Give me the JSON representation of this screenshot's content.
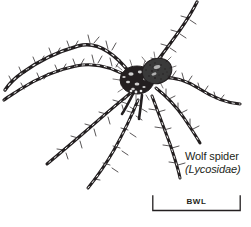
{
  "figure": {
    "background_color": "#ffffff",
    "ink_color": "#231f20",
    "alt": "Black and white ink illustration of a wolf spider seen from above with eight long banded spiny legs"
  },
  "caption": {
    "common_name": "Wolf spider",
    "scientific_name": "(Lycosidae)"
  },
  "scale_bar": {
    "label": "BWL",
    "bracket_style": "square-ends",
    "orientation": "horizontal"
  }
}
